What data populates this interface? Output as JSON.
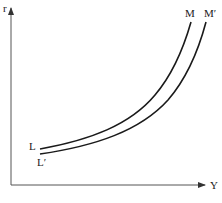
{
  "diagram": {
    "type": "IS-LM style diagram",
    "axes": {
      "y_axis_label": "r",
      "x_axis_label": "Y"
    },
    "curves": [
      {
        "name": "LM",
        "start_label": "L",
        "end_label": "M"
      },
      {
        "name": "L'M'",
        "start_label": "L′",
        "end_label": "M′"
      }
    ],
    "colors": {
      "line": "#1a1a1a",
      "axis": "#555555",
      "background": "#ffffff"
    }
  }
}
